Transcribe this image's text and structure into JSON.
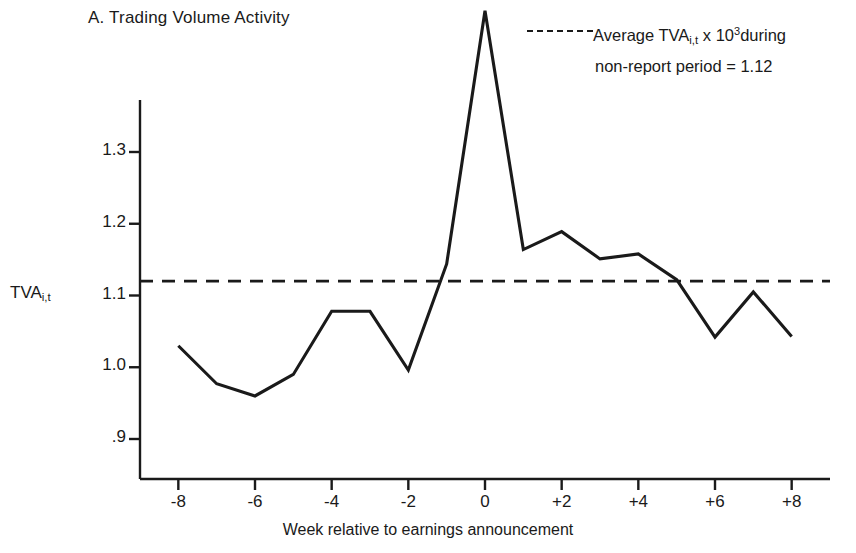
{
  "figure": {
    "panel_title": "A. Trading Volume Activity",
    "y_axis_label_main": "TVA",
    "y_axis_label_sub": "i,t",
    "x_axis_label": "Week relative to earnings announcement",
    "legend": {
      "line1_prefix": "Average TVA",
      "line1_sub": "i,t",
      "line1_mid": " x 10",
      "line1_sup": "3",
      "line1_suffix": "during",
      "line2": "non-report period = 1.12",
      "dash_style": "dashed"
    },
    "colors": {
      "line": "#1a1a1a",
      "axis": "#1a1a1a",
      "background": "#ffffff"
    }
  },
  "chart_data": {
    "type": "line",
    "title": "A. Trading Volume Activity",
    "xlabel": "Week relative to earnings announcement",
    "ylabel": "TVA i,t",
    "x": [
      -8,
      -7,
      -6,
      -5,
      -4,
      -3,
      -2,
      -1,
      0,
      1,
      2,
      3,
      4,
      5,
      6,
      7,
      8
    ],
    "xtick_labels": [
      "-8",
      "-6",
      "-4",
      "-2",
      "0",
      "+2",
      "+4",
      "+6",
      "+8"
    ],
    "xtick_values": [
      -8,
      -6,
      -4,
      -2,
      0,
      2,
      4,
      6,
      8
    ],
    "ytick_labels": [
      "1.3",
      "1.2",
      "1.1",
      "1.0",
      ".9"
    ],
    "ytick_values": [
      1.3,
      1.2,
      1.1,
      1.0,
      0.9
    ],
    "xlim": [
      -9,
      9
    ],
    "ylim": [
      0.86,
      1.51
    ],
    "grid": false,
    "legend_position": "top-right",
    "series": [
      {
        "name": "TVA_i,t x 10^3",
        "style": "solid",
        "values": [
          1.03,
          0.977,
          0.96,
          0.99,
          1.078,
          1.078,
          0.996,
          1.144,
          1.497,
          1.164,
          1.189,
          1.151,
          1.158,
          1.122,
          1.042,
          1.105,
          1.043
        ]
      },
      {
        "name": "Average TVA_i,t x 10^3 during non-report period",
        "style": "dashed",
        "constant": 1.12
      }
    ],
    "annotations": [
      "Average TVA i,t x 10^3 during non-report period = 1.12"
    ]
  }
}
